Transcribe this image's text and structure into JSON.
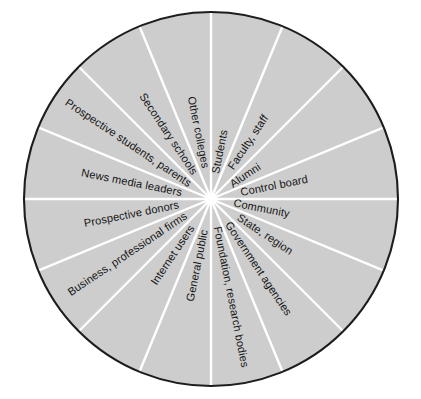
{
  "figure": {
    "name": "stakeholder-wheel",
    "shape": "circle",
    "sector_count": 16,
    "colors": {
      "sector_fill": "#cdcdcd",
      "spoke": "#ffffff",
      "outline": "#1d1d1d",
      "label_text": "#141414",
      "background": "#ffffff"
    }
  },
  "chart_data": {
    "type": "pie",
    "title": "",
    "subtitle": "",
    "xlabel": "",
    "ylabel": "",
    "legend_position": "none",
    "grid": false,
    "equal_slices": true,
    "slice_angle_degrees": 22.5,
    "start_angle_degrees": -90,
    "categories": [
      "Students",
      "Faculty, staff",
      "Alumni",
      "Control board",
      "Community",
      "State, region",
      "Government agencies",
      "Foundation, research bodies",
      "General public",
      "Internet users",
      "Business, professional firms",
      "Prospective donors",
      "News media leaders",
      "Prospective students, parents",
      "Secondary schools",
      "Other colleges"
    ],
    "values": [
      6.25,
      6.25,
      6.25,
      6.25,
      6.25,
      6.25,
      6.25,
      6.25,
      6.25,
      6.25,
      6.25,
      6.25,
      6.25,
      6.25,
      6.25,
      6.25
    ]
  },
  "sectors": [
    {
      "label": "Students",
      "mid_angle": -78.75
    },
    {
      "label": "Faculty, staff",
      "mid_angle": -56.25
    },
    {
      "label": "Alumni",
      "mid_angle": -33.75
    },
    {
      "label": "Control board",
      "mid_angle": -11.25
    },
    {
      "label": "Community",
      "mid_angle": 11.25
    },
    {
      "label": "State, region",
      "mid_angle": 33.75
    },
    {
      "label": "Government agencies",
      "mid_angle": 56.25
    },
    {
      "label": "Foundation, research bodies",
      "mid_angle": 78.75
    },
    {
      "label": "General public",
      "mid_angle": 101.25
    },
    {
      "label": "Internet users",
      "mid_angle": 123.75
    },
    {
      "label": "Business, professional firms",
      "mid_angle": 146.25
    },
    {
      "label": "Prospective donors",
      "mid_angle": 168.75
    },
    {
      "label": "News media leaders",
      "mid_angle": 191.25
    },
    {
      "label": "Prospective students, parents",
      "mid_angle": 213.75
    },
    {
      "label": "Secondary schools",
      "mid_angle": 236.25
    },
    {
      "label": "Other colleges",
      "mid_angle": 258.75
    }
  ]
}
